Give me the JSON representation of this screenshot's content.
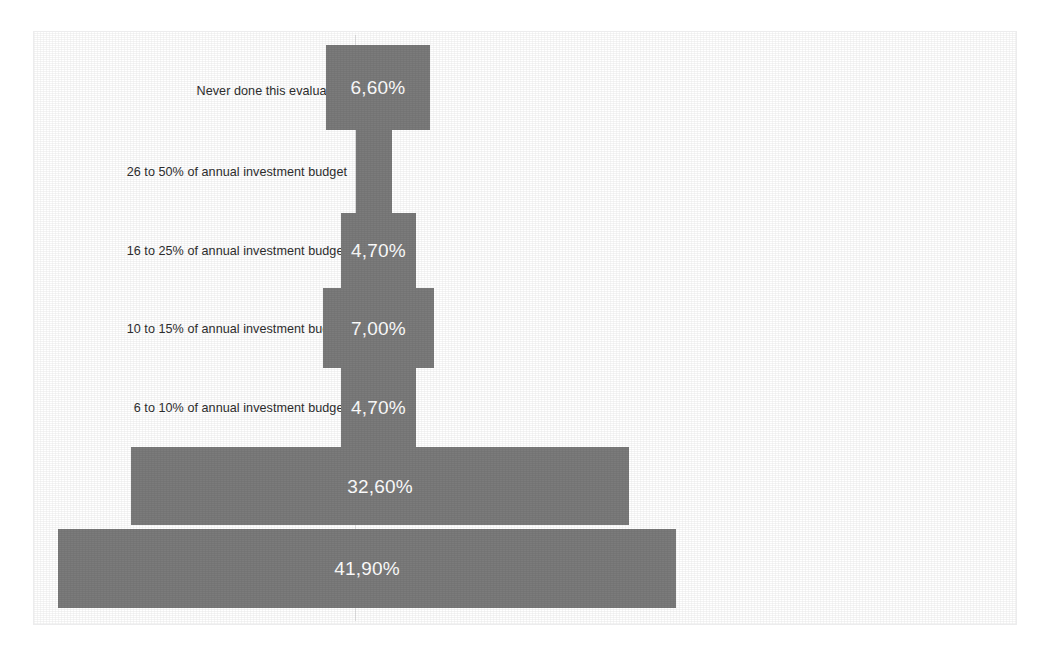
{
  "chart_data": {
    "type": "bar",
    "title": "",
    "subtitle": "",
    "xlabel": "",
    "ylabel": "",
    "orientation": "horizontal",
    "bar_alignment": "centered-funnel",
    "grid": false,
    "legend": false,
    "axis_ticks": [],
    "value_suffix": "%",
    "decimal_separator": ",",
    "colors": {
      "bar": "#7b7b7b",
      "bar_label_text": "#ffffff",
      "category_label_text": "#2e2e2e",
      "frame_border": "#ececed",
      "axis_line": "#e2e2e3",
      "background": "#ffffff"
    },
    "categories": [
      "Never done this evaluation",
      "26 to 50% of annual investment budget",
      "16 to 25% of annual investment budget",
      "10 to 15% of annual investment budget",
      "6 to 10% of annual investment budget",
      "3 to 5% of annual investment budget",
      "0 to 2% of annual investment budget"
    ],
    "values": [
      6.6,
      2.4,
      4.7,
      7.0,
      4.7,
      32.6,
      41.9
    ],
    "value_labels": [
      "6,60%",
      "",
      "4,70%",
      "7,00%",
      "4,70%",
      "32,60%",
      "41,90%"
    ],
    "xlim": [
      0,
      41.9
    ],
    "bars": [
      {
        "category": "Never done this evaluation",
        "value": 6.6,
        "label": "6,60%",
        "label_visible": true,
        "left": 292,
        "top": 13,
        "width": 104,
        "height": 85
      },
      {
        "category": "26 to 50% of annual investment budget",
        "value": 2.4,
        "label": "",
        "label_visible": false,
        "left": 322,
        "top": 98,
        "width": 36,
        "height": 83
      },
      {
        "category": "16 to 25% of annual investment budget",
        "value": 4.7,
        "label": "4,70%",
        "label_visible": true,
        "left": 307,
        "top": 181,
        "width": 75,
        "height": 75
      },
      {
        "category": "10 to 15% of annual investment budget",
        "value": 7.0,
        "label": "7,00%",
        "label_visible": true,
        "left": 289,
        "top": 256,
        "width": 111,
        "height": 80
      },
      {
        "category": "6 to 10% of annual investment budget",
        "value": 4.7,
        "label": "4,70%",
        "label_visible": true,
        "left": 307,
        "top": 336,
        "width": 75,
        "height": 79
      },
      {
        "category": "3 to 5% of annual investment budget",
        "value": 32.6,
        "label": "32,60%",
        "label_visible": true,
        "left": 97,
        "top": 415,
        "width": 498,
        "height": 78
      },
      {
        "category": "0 to 2% of annual investment budget",
        "value": 41.9,
        "label": "41,90%",
        "label_visible": true,
        "left": 24,
        "top": 497,
        "width": 618,
        "height": 79
      }
    ],
    "category_label_positions": [
      {
        "label": "Never done this evaluation",
        "top": 53
      },
      {
        "label": "26 to 50% of annual investment budget",
        "top": 134
      },
      {
        "label": "16 to 25% of annual investment budget",
        "top": 213
      },
      {
        "label": "10 to 15% of annual investment budget",
        "top": 291
      },
      {
        "label": "6 to 10% of annual investment budget",
        "top": 370
      },
      {
        "label": "3 to 5% of annual investment budget",
        "top": 449
      },
      {
        "label": "0 to 2% of annual investment budget",
        "top": 531
      }
    ]
  }
}
